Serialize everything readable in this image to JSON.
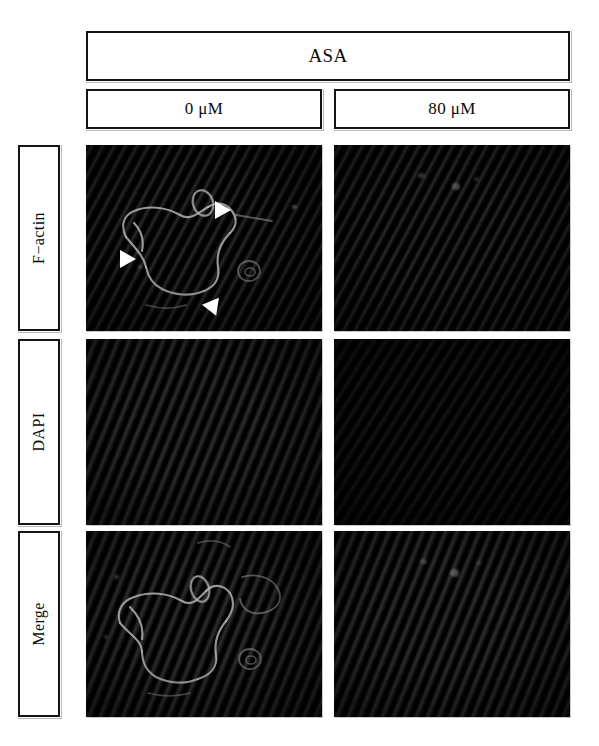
{
  "figure": {
    "type": "immunofluorescence-micrograph-grid",
    "treatment_header": "ASA",
    "columns": [
      {
        "id": "dose-0",
        "label": "0 μM"
      },
      {
        "id": "dose-80",
        "label": "80 μM"
      }
    ],
    "rows": [
      {
        "id": "row-factin",
        "label": "F−actin"
      },
      {
        "id": "row-dapi",
        "label": "DAPI"
      },
      {
        "id": "row-merge",
        "label": "Merge"
      }
    ],
    "panels": [
      {
        "row": "F−actin",
        "column": "0 μM",
        "description": "Dark field with diagonal striations; bright cortical F-actin outlines forming polygonal cell borders; three white arrowheads mark stress-fiber / membrane ruffles",
        "arrowhead_count": 3,
        "signal": "strong"
      },
      {
        "row": "F−actin",
        "column": "80 μM",
        "description": "Dark field with diagonal striations; F-actin staining largely absent, only faint specks",
        "arrowhead_count": 0,
        "signal": "weak"
      },
      {
        "row": "DAPI",
        "column": "0 μM",
        "description": "Dark field with diagonal striations; no discernible nuclear signal",
        "arrowhead_count": 0,
        "signal": "none"
      },
      {
        "row": "DAPI",
        "column": "80 μM",
        "description": "Dark field with diagonal striations; no discernible nuclear signal",
        "arrowhead_count": 0,
        "signal": "none"
      },
      {
        "row": "Merge",
        "column": "0 μM",
        "description": "Merged channel showing the same polygonal cell outlines as the F-actin panel, no arrowheads",
        "arrowhead_count": 0,
        "signal": "strong"
      },
      {
        "row": "Merge",
        "column": "80 μM",
        "description": "Merged channel, essentially dark with two faint specks near the top",
        "arrowhead_count": 0,
        "signal": "weak"
      }
    ],
    "colors": {
      "background": "#ffffff",
      "box_border": "#141414",
      "panel_background": "#000000",
      "stain_signal": "#b9b9b9",
      "arrowhead": "#ffffff",
      "text": "#0b0b0b"
    }
  }
}
